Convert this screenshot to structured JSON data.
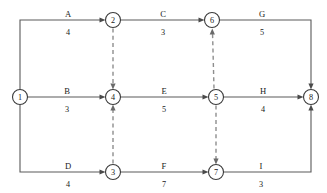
{
  "diagram": {
    "type": "activity-on-arrow-network",
    "title": "",
    "canvas": {
      "width": 327,
      "height": 193,
      "background": "#ffffff"
    },
    "colors": {
      "solid_edge": "#5a5a5a",
      "dashed_edge": "#8e8e8e",
      "node_stroke": "#3b3b3b",
      "node_fill": "#ffffff",
      "text": "#1a1a1a"
    },
    "nodes": [
      {
        "id": "n1",
        "label": "1",
        "x": 20,
        "y": 97,
        "r": 7.5
      },
      {
        "id": "n2",
        "label": "2",
        "x": 113,
        "y": 20,
        "r": 7.5
      },
      {
        "id": "n3",
        "label": "3",
        "x": 113,
        "y": 172,
        "r": 7.5
      },
      {
        "id": "n4",
        "label": "4",
        "x": 113,
        "y": 97,
        "r": 7.5
      },
      {
        "id": "n5",
        "label": "5",
        "x": 216,
        "y": 97,
        "r": 7.5
      },
      {
        "id": "n6",
        "label": "6",
        "x": 212,
        "y": 20,
        "r": 7.5
      },
      {
        "id": "n7",
        "label": "7",
        "x": 216,
        "y": 172,
        "r": 7.5
      },
      {
        "id": "n8",
        "label": "8",
        "x": 311,
        "y": 97,
        "r": 7.5
      }
    ],
    "edges": [
      {
        "id": "eA",
        "name": "A",
        "duration": "4",
        "from": "1",
        "to": "2",
        "style": "solid",
        "name_x": 68,
        "name_y": 17,
        "dur_x": 68,
        "dur_y": 35
      },
      {
        "id": "eC",
        "name": "C",
        "duration": "3",
        "from": "2",
        "to": "6",
        "style": "solid",
        "name_x": 163,
        "name_y": 17,
        "dur_x": 163,
        "dur_y": 35
      },
      {
        "id": "eG",
        "name": "G",
        "duration": "5",
        "from": "6",
        "to": "8",
        "style": "solid",
        "name_x": 262,
        "name_y": 17,
        "dur_x": 262,
        "dur_y": 35
      },
      {
        "id": "eB",
        "name": "B",
        "duration": "3",
        "from": "1",
        "to": "4",
        "style": "solid",
        "name_x": 67,
        "name_y": 94,
        "dur_x": 67,
        "dur_y": 112
      },
      {
        "id": "eE",
        "name": "E",
        "duration": "5",
        "from": "4",
        "to": "5",
        "style": "solid",
        "name_x": 164,
        "name_y": 94,
        "dur_x": 164,
        "dur_y": 112
      },
      {
        "id": "eH",
        "name": "H",
        "duration": "4",
        "from": "5",
        "to": "8",
        "style": "solid",
        "name_x": 263,
        "name_y": 94,
        "dur_x": 263,
        "dur_y": 112
      },
      {
        "id": "eD",
        "name": "D",
        "duration": "4",
        "from": "1",
        "to": "3",
        "style": "solid",
        "name_x": 68,
        "name_y": 169,
        "dur_x": 68,
        "dur_y": 187
      },
      {
        "id": "eF",
        "name": "F",
        "duration": "7",
        "from": "3",
        "to": "7",
        "style": "solid",
        "name_x": 164,
        "name_y": 169,
        "dur_x": 164,
        "dur_y": 187
      },
      {
        "id": "eI",
        "name": "I",
        "duration": "3",
        "from": "7",
        "to": "8",
        "style": "solid",
        "name_x": 261,
        "name_y": 169,
        "dur_x": 261,
        "dur_y": 187
      }
    ],
    "dummy_edges": [
      {
        "id": "d24",
        "from": "2",
        "to": "4",
        "style": "dashed",
        "direction": "down"
      },
      {
        "id": "d34",
        "from": "3",
        "to": "4",
        "style": "dashed",
        "direction": "up"
      },
      {
        "id": "d56",
        "from": "5",
        "to": "6",
        "style": "dashed",
        "direction": "up"
      },
      {
        "id": "d57",
        "from": "5",
        "to": "7",
        "style": "dashed",
        "direction": "down"
      }
    ]
  }
}
